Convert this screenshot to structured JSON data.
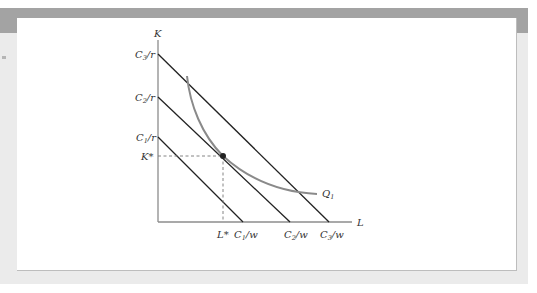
{
  "figure": {
    "type": "isoquant-isocost diagram",
    "axes": {
      "y_label": "K",
      "x_label": "L"
    },
    "isocost_lines": [
      {
        "name": "C1",
        "k_intercept_label": {
          "main": "C",
          "sub": "1",
          "tail": "/r"
        },
        "l_intercept_label": {
          "main": "C",
          "sub": "1",
          "tail": "/w"
        }
      },
      {
        "name": "C2",
        "k_intercept_label": {
          "main": "C",
          "sub": "2",
          "tail": "/r"
        },
        "l_intercept_label": {
          "main": "C",
          "sub": "2",
          "tail": "/w"
        }
      },
      {
        "name": "C3",
        "k_intercept_label": {
          "main": "C",
          "sub": "3",
          "tail": "/r"
        },
        "l_intercept_label": {
          "main": "C",
          "sub": "3",
          "tail": "/w"
        }
      }
    ],
    "isoquant": {
      "label_main": "Q",
      "label_sub": "1"
    },
    "optimum": {
      "k_label": "K*",
      "l_label": "L*"
    },
    "colors": {
      "line": "#222222",
      "isoquant": "#8a8a8a",
      "axis": "#8c8c8c",
      "dashed": "#777777",
      "band": "#a3a3a3",
      "frame": "#ebebeb"
    }
  }
}
